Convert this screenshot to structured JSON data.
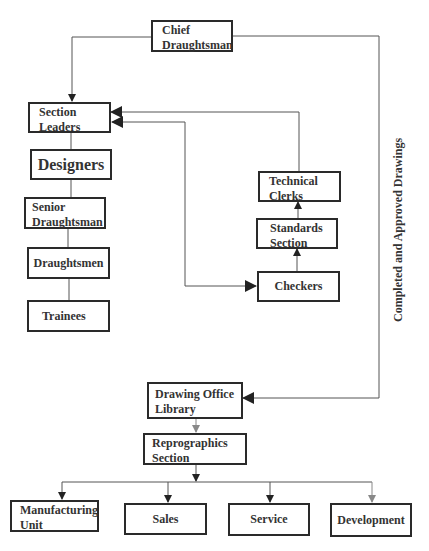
{
  "diagram": {
    "nodes": {
      "chief": {
        "line1": "Chief",
        "line2": "Draughtsman"
      },
      "section_leaders": {
        "line1": "Section",
        "line2": "Leaders"
      },
      "designers": {
        "label": "Designers"
      },
      "senior_draughtsman": {
        "line1": "Senior",
        "line2": "Draughtsman"
      },
      "draughtsmen": {
        "label": "Draughtsmen"
      },
      "trainees": {
        "label": "Trainees"
      },
      "technical_clerks": {
        "line1": "Technical",
        "line2": "Clerks"
      },
      "standards_section": {
        "line1": "Standards",
        "line2": "Section"
      },
      "checkers": {
        "label": "Checkers"
      },
      "drawing_office_library": {
        "line1": "Drawing Office",
        "line2": "Library"
      },
      "reprographics_section": {
        "line1": "Reprographics",
        "line2": "Section"
      },
      "manufacturing_unit": {
        "line1": "Manufacturing",
        "line2": "Unit"
      },
      "sales": {
        "label": "Sales"
      },
      "service": {
        "label": "Service"
      },
      "development": {
        "label": "Development"
      }
    },
    "edge_label": "Completed and Approved Drawings",
    "colors": {
      "border": "#2a2a2a",
      "line": "#555555",
      "text": "#333333"
    }
  }
}
